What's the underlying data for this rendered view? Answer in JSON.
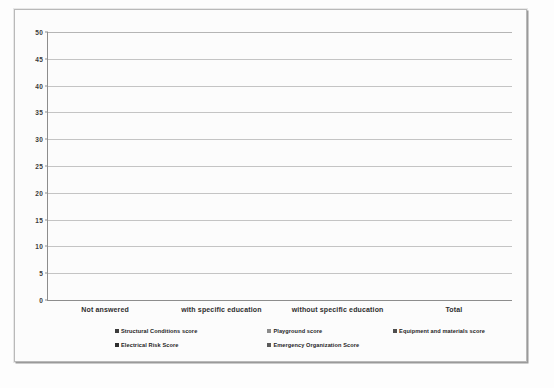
{
  "chart_data": {
    "type": "bar",
    "title": "",
    "subtitle": "",
    "xlabel": "",
    "ylabel": "",
    "ylim": [
      0,
      50
    ],
    "ytick_step": 5,
    "yticks": [
      "0",
      "5",
      "10",
      "15",
      "20",
      "25",
      "30",
      "35",
      "40",
      "45",
      "50"
    ],
    "grid": true,
    "legend_position": "bottom",
    "categories": [
      "Not answered",
      "with specific education",
      "without specific education",
      "Total"
    ],
    "series": [
      {
        "name": "Structural Conditions score",
        "color": "#3c3c3c",
        "values": [
          30,
          32,
          31.5,
          32
        ]
      },
      {
        "name": "Playground score",
        "color": "#8b8b8b",
        "values": [
          28.5,
          26,
          25.8,
          26.2
        ]
      },
      {
        "name": "Equipment and materials score",
        "color": "#4e4e4e",
        "values": [
          24,
          21.5,
          21.4,
          21.8
        ]
      },
      {
        "name": "Electrical Risk Score",
        "color": "#2f2f2f",
        "values": [
          24,
          22,
          21.6,
          22.2
        ]
      },
      {
        "name": "Emergency Organization Score",
        "color": "#5a5a5a",
        "values": [
          47,
          45.8,
          45,
          45.8
        ]
      }
    ]
  },
  "legend": {
    "row1": [
      "Structural Conditions score",
      "Playground score",
      "Equipment and materials score"
    ],
    "row2": [
      "Electrical Risk Score",
      "Emergency Organization Score"
    ]
  },
  "colors": {
    "axis": "#8d8d8d",
    "gridline": "#c4c4c4",
    "frame_border": "#b9b9b9",
    "plot_background": "#fcfcfc",
    "page_background": "#fdfdfd",
    "text": "#2e2e2e"
  }
}
